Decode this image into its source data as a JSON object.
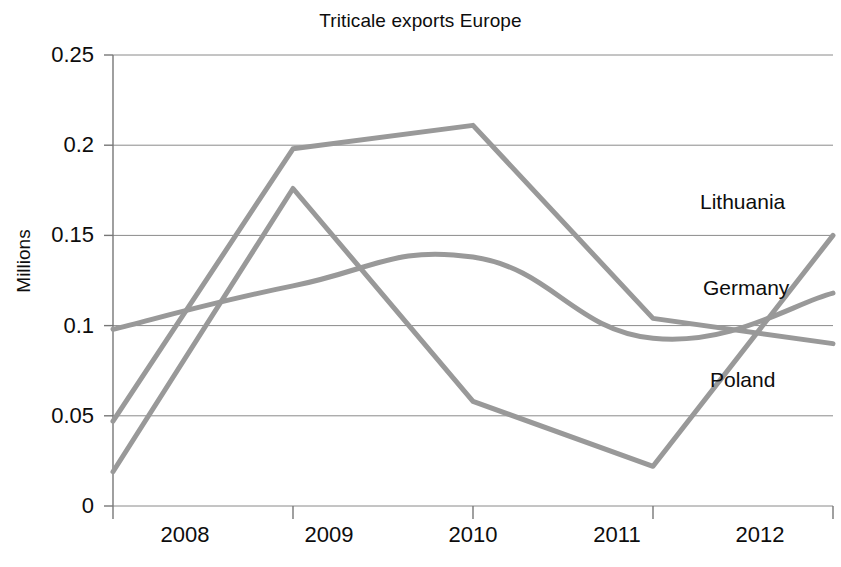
{
  "chart_data": {
    "type": "line",
    "title": "Triticale exports Europe",
    "xlabel": "",
    "ylabel": "Millions",
    "categories": [
      "2008",
      "2009",
      "2010",
      "2011",
      "2012"
    ],
    "x": [
      2008,
      2009,
      2010,
      2011,
      2012
    ],
    "xlim": [
      2008,
      2012
    ],
    "ylim": [
      0,
      0.25
    ],
    "yticks": [
      "0",
      "0.05",
      "0.1",
      "0.15",
      "0.2",
      "0.25"
    ],
    "ytick_values": [
      0,
      0.05,
      0.1,
      0.15,
      0.2,
      0.25
    ],
    "grid": true,
    "grid_axis": "y",
    "legend_position": "inline-right-annotations",
    "line_color": "#999999",
    "line_width": 5,
    "series": [
      {
        "name": "Lithuania",
        "values": [
          0.047,
          0.198,
          0.211,
          0.104,
          0.09
        ],
        "color": "#999999",
        "label_x": 700,
        "label_y": 190
      },
      {
        "name": "Germany",
        "values": [
          0.098,
          0.122,
          0.138,
          0.093,
          0.118
        ],
        "color": "#999999",
        "smooth": true,
        "label_x": 703,
        "label_y": 276
      },
      {
        "name": "Poland",
        "values": [
          0.019,
          0.176,
          0.058,
          0.022,
          0.15
        ],
        "color": "#999999",
        "label_x": 710,
        "label_y": 368
      }
    ]
  },
  "axes": {
    "y_tick_labels": [
      {
        "text": "0.25",
        "top": 42
      },
      {
        "text": "0.2",
        "top": 132
      },
      {
        "text": "0.15",
        "top": 222
      },
      {
        "text": "0.1",
        "top": 313
      },
      {
        "text": "0.05",
        "top": 403
      },
      {
        "text": "0",
        "top": 493
      }
    ],
    "x_tick_labels": [
      {
        "text": "2008",
        "left": 125
      },
      {
        "text": "2009",
        "left": 269
      },
      {
        "text": "2010",
        "left": 413
      },
      {
        "text": "2011",
        "left": 557
      },
      {
        "text": "2012",
        "left": 700
      }
    ]
  }
}
